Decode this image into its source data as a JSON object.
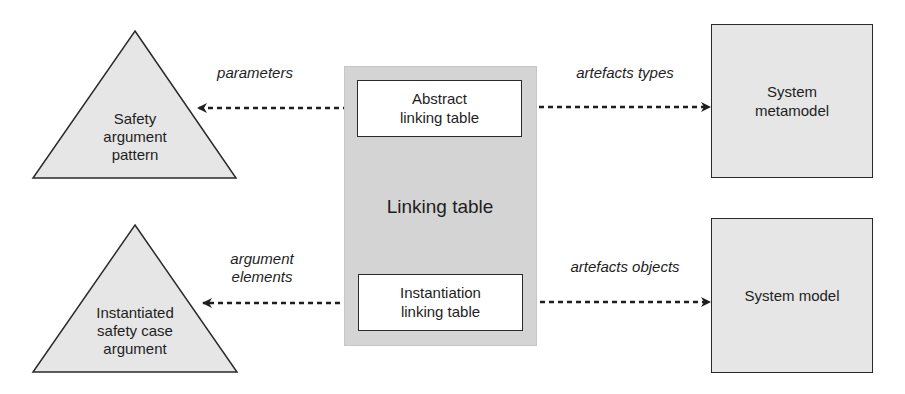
{
  "diagram": {
    "center": {
      "label": "Linking table",
      "abstract_table": "Abstract linking table",
      "abstract_lines": [
        "Abstract",
        "linking table"
      ],
      "instantiation_table": "Instantiation linking table",
      "instantiation_lines": [
        "Instantiation",
        "linking table"
      ]
    },
    "left": {
      "top_triangle": {
        "lines": [
          "Safety",
          "argument",
          "pattern"
        ]
      },
      "bottom_triangle": {
        "lines": [
          "Instantiated",
          "safety case",
          "argument"
        ]
      }
    },
    "right": {
      "top_box": {
        "lines": [
          "System",
          "metamodel"
        ]
      },
      "bottom_box": {
        "label": "System model"
      }
    },
    "edges": {
      "top_left": {
        "lines": [
          "parameters"
        ]
      },
      "bottom_left": {
        "lines": [
          "argument",
          "elements"
        ]
      },
      "top_right": {
        "label": "artefacts types"
      },
      "bottom_right": {
        "label": "artefacts objects"
      }
    },
    "colors": {
      "triangle_fill": "#e6e6e6",
      "center_fill": "#d4d4d4",
      "box_fill": "#e6e6e6",
      "stroke": "#2a2a2a"
    }
  }
}
